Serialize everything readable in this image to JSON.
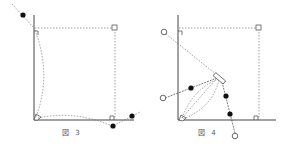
{
  "figures": [
    {
      "id": "fig3",
      "caption": "図 3"
    },
    {
      "id": "fig4",
      "caption": "図 4"
    }
  ],
  "colors": {
    "line": "#444444",
    "dot": "#111111",
    "dotted": "#777777"
  }
}
